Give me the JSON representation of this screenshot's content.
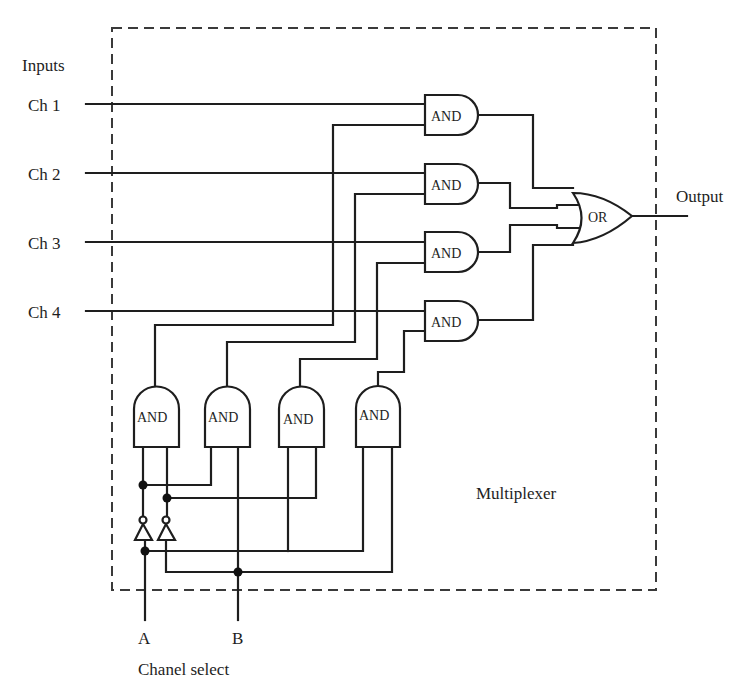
{
  "labels": {
    "inputs": "Inputs",
    "output": "Output",
    "block": "Multiplexer",
    "select_group": "Chanel select"
  },
  "channels": [
    {
      "label": "Ch 1"
    },
    {
      "label": "Ch 2"
    },
    {
      "label": "Ch 3"
    },
    {
      "label": "Ch 4"
    }
  ],
  "select_lines": [
    {
      "label": "A"
    },
    {
      "label": "B"
    }
  ],
  "channel_gates": [
    {
      "label": "AND"
    },
    {
      "label": "AND"
    },
    {
      "label": "AND"
    },
    {
      "label": "AND"
    }
  ],
  "decoder_gates": [
    {
      "label": "AND",
      "inputs": "A' B'"
    },
    {
      "label": "AND",
      "inputs": "A' B"
    },
    {
      "label": "AND",
      "inputs": "A B'"
    },
    {
      "label": "AND",
      "inputs": "A B"
    }
  ],
  "or_gate": {
    "label": "OR"
  },
  "inverters": [
    {
      "input": "A"
    },
    {
      "input": "B"
    }
  ],
  "colors": {
    "line": "#1e1e1e",
    "boundary": "#3a3a3a",
    "background": "#ffffff"
  }
}
